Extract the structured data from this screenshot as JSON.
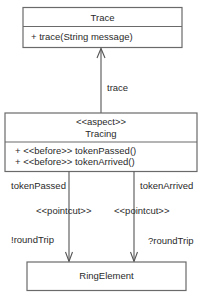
{
  "diagram": {
    "type": "uml-class-diagram",
    "classes": {
      "trace": {
        "name": "Trace",
        "operations": [
          "+ trace(String message)"
        ]
      },
      "tracing": {
        "stereotype": "<<aspect>>",
        "name": "Tracing",
        "operations": [
          "+ <<before>> tokenPassed()",
          "+ <<before>> tokenArrived()"
        ]
      },
      "ring_element": {
        "name": "RingElement"
      }
    },
    "connections": {
      "trace_dependency": {
        "from": "Tracing",
        "to": "Trace",
        "label": "trace"
      },
      "token_passed": {
        "from": "Tracing",
        "to": "RingElement",
        "source_label": "tokenPassed",
        "stereotype": "<<pointcut>>",
        "target_label": "!roundTrip"
      },
      "token_arrived": {
        "from": "Tracing",
        "to": "RingElement",
        "source_label": "tokenArrived",
        "stereotype": "<<pointcut>>",
        "target_label": "?roundTrip"
      }
    }
  }
}
